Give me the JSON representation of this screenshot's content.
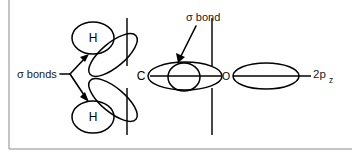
{
  "diagram": {
    "background_color": "#ffffff",
    "stroke_color": "#000000",
    "frame_color": "#8a8a8a",
    "atoms": [
      {
        "id": "carbon",
        "label": "C",
        "x": 141,
        "y": 76
      },
      {
        "id": "oxygen",
        "label": "O",
        "x": 226,
        "y": 76
      },
      {
        "id": "hydrogen-upper",
        "label": "H",
        "x": 93,
        "y": 38
      },
      {
        "id": "hydrogen-lower",
        "label": "H",
        "x": 93,
        "y": 117
      }
    ],
    "annotations": [
      {
        "id": "sigma-bonds-label",
        "text": "σ bonds",
        "x": 17,
        "y": 74,
        "description": "Label with branching arrows pointing to the two C–H sigma bonds"
      },
      {
        "id": "sigma-bond-label",
        "text": "σ bond",
        "x": 186,
        "y": 17,
        "description": "Label with arrow pointing to the C–O sigma overlap region"
      }
    ],
    "orbital_labels": [
      {
        "id": "two-p-z-label",
        "base": "2p",
        "subscript": "z",
        "x": 313,
        "y": 76,
        "description": "Unhybridized 2p_z orbital on oxygen"
      }
    ],
    "node_lines": [
      {
        "id": "carbon-nodal-plane",
        "x": 127,
        "y_top": 18,
        "y_bottom": 135
      },
      {
        "id": "oxygen-nodal-plane",
        "x": 212,
        "y_top": 18,
        "y_bottom": 135
      }
    ],
    "frame": {
      "left_border": {
        "x": 9,
        "y_top": 0,
        "y_bottom": 149
      },
      "bottom_border": {
        "y": 149,
        "x_left": 9,
        "x_right": 350
      }
    }
  }
}
